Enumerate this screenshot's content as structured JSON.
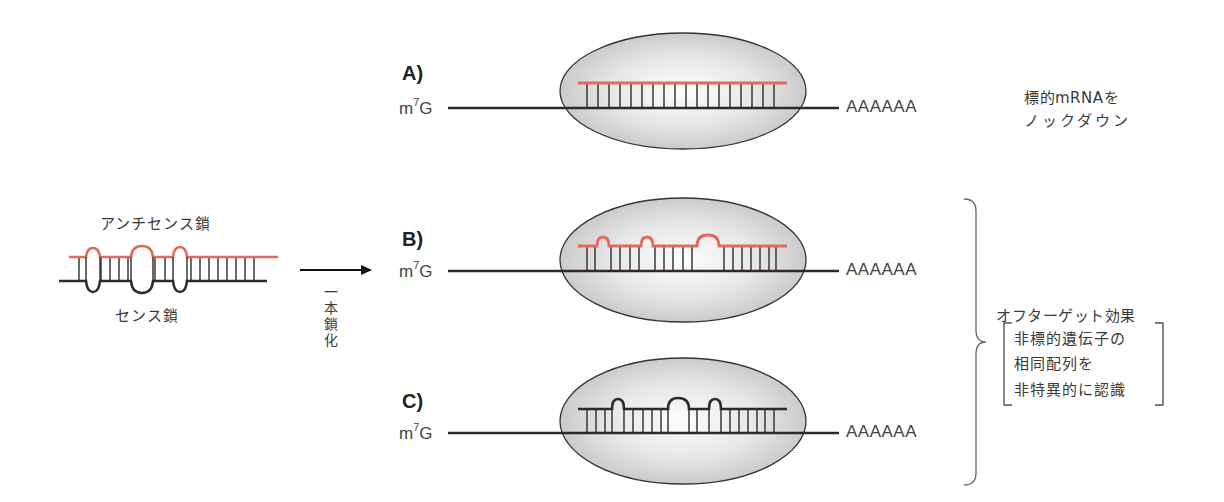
{
  "figure": {
    "left_duplex": {
      "antisense_label": "アンチセンス鎖",
      "sense_label": "センス鎖",
      "antisense_color": "#e06a60",
      "sense_color": "#2b2b2b"
    },
    "arrow": {
      "label_chars": [
        "一",
        "本",
        "鎖",
        "化"
      ]
    },
    "panels": [
      {
        "letter": "A)",
        "cap": "m",
        "cap_sup": "7",
        "cap_tail": "G",
        "polyA": "AAAAAA",
        "guide_color": "#e06a60",
        "mismatch": "none"
      },
      {
        "letter": "B)",
        "cap": "m",
        "cap_sup": "7",
        "cap_tail": "G",
        "polyA": "AAAAAA",
        "guide_color": "#e06a60",
        "mismatch": "bulges"
      },
      {
        "letter": "C)",
        "cap": "m",
        "cap_sup": "7",
        "cap_tail": "G",
        "polyA": "AAAAAA",
        "guide_color": "#2b2b2b",
        "mismatch": "bulges"
      }
    ],
    "result_a": {
      "line1": "標的mRNAを",
      "line2": "ノックダウン"
    },
    "result_bc": {
      "title": "オフターゲット効果",
      "bracket_lines": [
        "非標的遺伝子の",
        "相同配列を",
        "非特異的に認識"
      ]
    },
    "colors": {
      "ellipse_fill_center": "#fbfbfb",
      "ellipse_fill_edge": "#c9c9c9",
      "outline": "#2b2b2b",
      "red_strand": "#e06a60"
    }
  }
}
